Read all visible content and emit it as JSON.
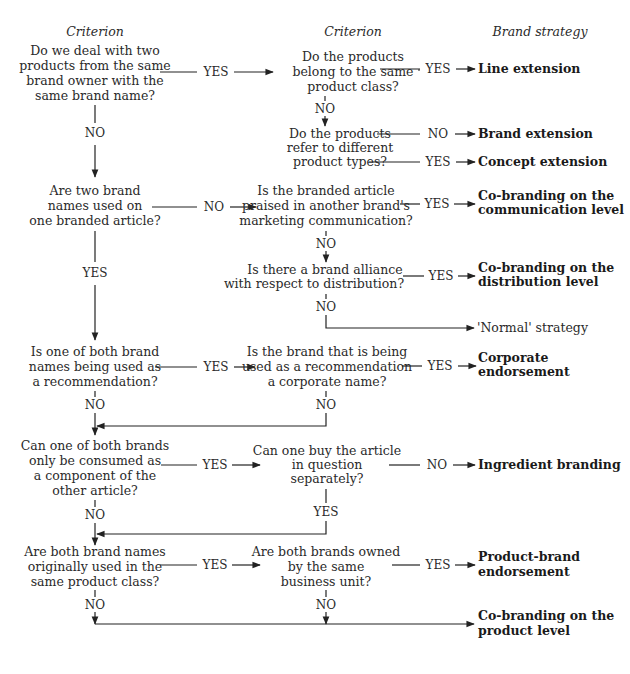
{
  "headers": {
    "col1": "Criterion",
    "col2": "Criterion",
    "col3": "Brand strategy"
  },
  "labels": {
    "yes": "YES",
    "no": "NO"
  },
  "criteria_left": [
    {
      "id": "q1",
      "lines": [
        "Do we deal with two",
        "products from the same",
        "brand owner with the",
        "same brand name?"
      ]
    },
    {
      "id": "q2",
      "lines": [
        "Are two brand",
        "names used on",
        "one branded article?"
      ]
    },
    {
      "id": "q3",
      "lines": [
        "Is one of both brand",
        "names being used as",
        "a recommendation?"
      ]
    },
    {
      "id": "q4",
      "lines": [
        "Can one of both brands",
        "only be consumed as",
        "a component of the",
        "other article?"
      ]
    },
    {
      "id": "q5",
      "lines": [
        "Are both brand names",
        "originally used in the",
        "same product class?"
      ]
    }
  ],
  "criteria_middle": [
    {
      "id": "m1",
      "lines": [
        "Do the products",
        "belong to the same",
        "product class?"
      ]
    },
    {
      "id": "m2",
      "lines": [
        "Do the products",
        "refer to different",
        "product types?"
      ]
    },
    {
      "id": "m3",
      "lines": [
        "Is the branded article",
        "praised in another brand's",
        "marketing communication?"
      ]
    },
    {
      "id": "m4",
      "lines": [
        "Is there a brand alliance",
        "with respect to distribution?"
      ]
    },
    {
      "id": "m5",
      "lines": [
        "Is the brand that is being",
        "used as a recommendation",
        "a corporate name?"
      ]
    },
    {
      "id": "m6",
      "lines": [
        "Can one buy the article",
        "in question",
        "separately?"
      ]
    },
    {
      "id": "m7",
      "lines": [
        "Are both brands owned",
        "by the same",
        "business unit?"
      ]
    }
  ],
  "strategies": [
    {
      "id": "s1",
      "lines": [
        "Line extension"
      ]
    },
    {
      "id": "s2",
      "lines": [
        "Brand extension"
      ]
    },
    {
      "id": "s3",
      "lines": [
        "Concept extension"
      ]
    },
    {
      "id": "s4",
      "lines": [
        "Co-branding on the",
        "communication level"
      ]
    },
    {
      "id": "s5",
      "lines": [
        "Co-branding on the",
        "distribution level"
      ]
    },
    {
      "id": "s6",
      "lines": [
        "'Normal' strategy"
      ]
    },
    {
      "id": "s7",
      "lines": [
        "Corporate",
        "endorsement"
      ]
    },
    {
      "id": "s8",
      "lines": [
        "Ingredient branding"
      ]
    },
    {
      "id": "s9",
      "lines": [
        "Product-brand",
        "endorsement"
      ]
    },
    {
      "id": "s10",
      "lines": [
        "Co-branding on the",
        "product level"
      ]
    }
  ]
}
